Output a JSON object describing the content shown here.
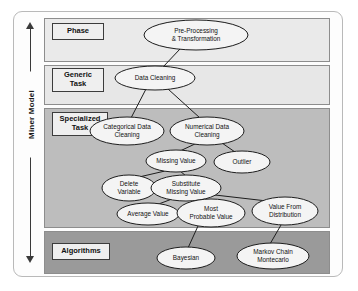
{
  "diagram": {
    "axis": {
      "label": "Miner Model",
      "arrow_up": "up-arrow",
      "arrow_down": "down-arrow"
    },
    "bands": [
      {
        "id": "phase",
        "label": "Phase",
        "color": "#eaeaea"
      },
      {
        "id": "generic",
        "label": "Generic\nTask",
        "label_line1": "Generic",
        "label_line2": "Task",
        "color": "#e7e7e7"
      },
      {
        "id": "special",
        "label": "Specialized\nTask",
        "label_line1": "Specialized",
        "label_line2": "Task",
        "color": "#bdbdbd"
      },
      {
        "id": "algorithms",
        "label": "Algorithms",
        "color": "#9a9a9a"
      }
    ],
    "nodes": [
      {
        "id": "pre_processing",
        "line1": "Pre-Processing",
        "line2": "& Transformation",
        "cx": 196,
        "cy": 35,
        "rx": 52,
        "ry": 15,
        "band": "phase"
      },
      {
        "id": "data_cleaning",
        "line1": "Data Cleaning",
        "line2": "",
        "cx": 155,
        "cy": 78,
        "rx": 40,
        "ry": 12,
        "band": "generic"
      },
      {
        "id": "categorical",
        "line1": "Categorical Data",
        "line2": "Cleaning",
        "cx": 127,
        "cy": 131,
        "rx": 37,
        "ry": 14,
        "band": "special"
      },
      {
        "id": "numerical",
        "line1": "Numerical Data",
        "line2": "Cleaning",
        "cx": 207,
        "cy": 131,
        "rx": 37,
        "ry": 14,
        "band": "special"
      },
      {
        "id": "missing_value",
        "line1": "Missing Value",
        "line2": "",
        "cx": 176,
        "cy": 161,
        "rx": 30,
        "ry": 11,
        "band": "special"
      },
      {
        "id": "outlier",
        "line1": "Outlier",
        "line2": "",
        "cx": 242,
        "cy": 162,
        "rx": 28,
        "ry": 11,
        "band": "special"
      },
      {
        "id": "delete_variable",
        "line1": "Delete",
        "line2": "Variable",
        "cx": 129,
        "cy": 188,
        "rx": 27,
        "ry": 13,
        "band": "special"
      },
      {
        "id": "substitute",
        "line1": "Substitute",
        "line2": "Missing Value",
        "cx": 186,
        "cy": 188,
        "rx": 35,
        "ry": 13,
        "band": "special"
      },
      {
        "id": "average_value",
        "line1": "Average Value",
        "line2": "",
        "cx": 148,
        "cy": 214,
        "rx": 31,
        "ry": 11,
        "band": "special"
      },
      {
        "id": "most_probable",
        "line1": "Most",
        "line2": "Probable Value",
        "cx": 211,
        "cy": 213,
        "rx": 34,
        "ry": 14,
        "band": "special"
      },
      {
        "id": "value_from_dist",
        "line1": "Value From",
        "line2": "Distribution",
        "cx": 285,
        "cy": 211,
        "rx": 33,
        "ry": 14,
        "band": "special"
      },
      {
        "id": "bayesian",
        "line1": "Bayesian",
        "line2": "",
        "cx": 186,
        "cy": 258,
        "rx": 29,
        "ry": 11,
        "band": "algorithms"
      },
      {
        "id": "markov_chain",
        "line1": "Markov Chain",
        "line2": "Montecarlo",
        "cx": 273,
        "cy": 256,
        "rx": 36,
        "ry": 13,
        "band": "algorithms"
      }
    ],
    "edges": [
      {
        "from": "pre_processing",
        "to": "data_cleaning",
        "x1": 180,
        "y1": 49,
        "x2": 163,
        "y2": 67
      },
      {
        "from": "data_cleaning",
        "to": "categorical",
        "x1": 146,
        "y1": 89,
        "x2": 131,
        "y2": 118
      },
      {
        "from": "data_cleaning",
        "to": "numerical",
        "x1": 168,
        "y1": 89,
        "x2": 200,
        "y2": 118
      },
      {
        "from": "numerical",
        "to": "missing_value",
        "x1": 197,
        "y1": 143,
        "x2": 180,
        "y2": 151
      },
      {
        "from": "numerical",
        "to": "outlier",
        "x1": 222,
        "y1": 143,
        "x2": 235,
        "y2": 152
      },
      {
        "from": "missing_value",
        "to": "delete_variable",
        "x1": 165,
        "y1": 171,
        "x2": 139,
        "y2": 177
      },
      {
        "from": "missing_value",
        "to": "substitute",
        "x1": 180,
        "y1": 171,
        "x2": 186,
        "y2": 176
      },
      {
        "from": "substitute",
        "to": "average_value",
        "x1": 172,
        "y1": 199,
        "x2": 156,
        "y2": 205
      },
      {
        "from": "substitute",
        "to": "most_probable",
        "x1": 196,
        "y1": 199,
        "x2": 206,
        "y2": 200
      },
      {
        "from": "substitute",
        "to": "value_from_dist",
        "x1": 215,
        "y1": 195,
        "x2": 267,
        "y2": 201
      },
      {
        "from": "most_probable",
        "to": "bayesian",
        "x1": 198,
        "y1": 226,
        "x2": 188,
        "y2": 248
      },
      {
        "from": "value_from_dist",
        "to": "markov_chain",
        "x1": 281,
        "y1": 225,
        "x2": 270,
        "y2": 244
      }
    ]
  }
}
